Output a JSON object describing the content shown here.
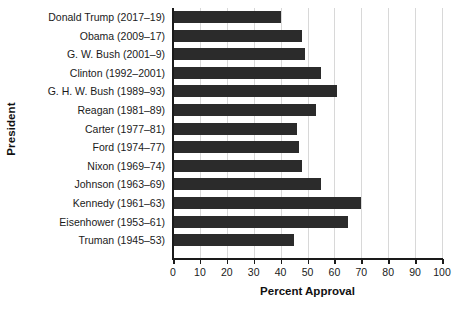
{
  "chart_data": {
    "type": "bar",
    "orientation": "horizontal",
    "title": "",
    "xlabel": "Percent Approval",
    "ylabel": "President",
    "xlim": [
      0,
      100
    ],
    "xticks": [
      0,
      10,
      20,
      30,
      40,
      50,
      60,
      70,
      80,
      90,
      100
    ],
    "grid": "vertical",
    "legend": "none",
    "bar_color": "#2b2b2b",
    "gridline_color": "#d8d8d8",
    "axis_color": "#1a1a1a",
    "categories": [
      "Donald Trump (2017–19)",
      "Obama (2009–17)",
      "G. W. Bush (2001–9)",
      "Clinton (1992–2001)",
      "G. H. W. Bush (1989–93)",
      "Reagan (1981–89)",
      "Carter (1977–81)",
      "Ford (1974–77)",
      "Nixon (1969–74)",
      "Johnson (1963–69)",
      "Kennedy (1961–63)",
      "Eisenhower (1953–61)",
      "Truman (1945–53)"
    ],
    "values": [
      40,
      48,
      49,
      55,
      61,
      53,
      46,
      47,
      48,
      55,
      70,
      65,
      45
    ]
  }
}
